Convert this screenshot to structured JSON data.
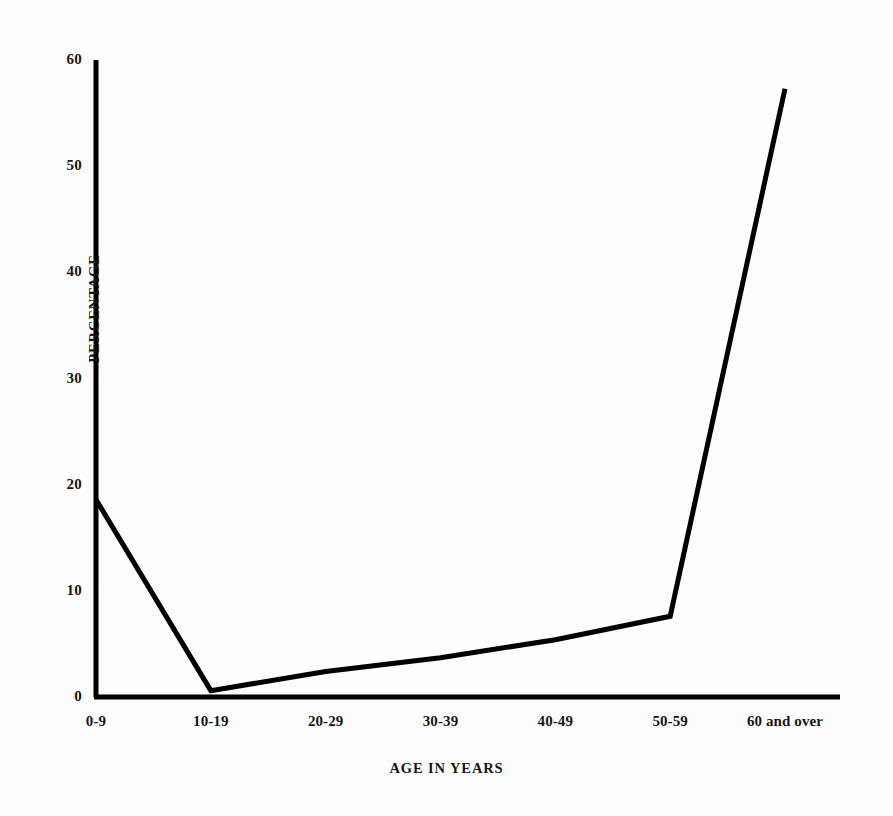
{
  "chart_data": {
    "type": "line",
    "title": "",
    "subtitle": "",
    "xlabel": "AGE IN YEARS",
    "ylabel": "PERCENTAGE",
    "categories": [
      "0-9",
      "10-19",
      "20-29",
      "30-39",
      "40-49",
      "50-59",
      "60 and over"
    ],
    "values": [
      18.6,
      0.6,
      2.4,
      3.7,
      5.4,
      7.6,
      57.3
    ],
    "ylim": [
      0,
      60
    ],
    "yticks": [
      0,
      10,
      20,
      30,
      40,
      50,
      60
    ],
    "ytick_labels": [
      "0",
      "10",
      "20",
      "30",
      "40",
      "50",
      "60"
    ],
    "grid": false,
    "legend": false,
    "legend_position": "none",
    "line_color": "#000000",
    "line_width": 5,
    "markers": false,
    "axis_color": "#000000",
    "background_color": "#fdfdfd"
  },
  "axes": {
    "y_title": "PERCENTAGE",
    "x_title": "AGE IN YEARS"
  }
}
